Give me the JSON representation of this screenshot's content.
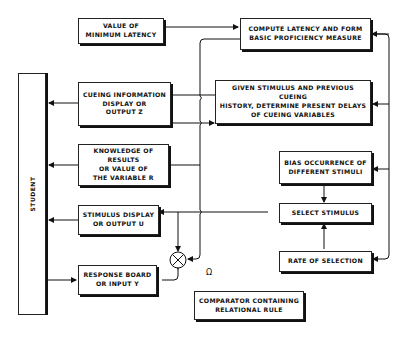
{
  "diagram": {
    "type": "block-diagram",
    "student": {
      "label": "STUDENT"
    },
    "boxes": {
      "min_latency": "VALUE OF\nMINIMUM LATENCY",
      "compute_latency": "COMPUTE LATENCY AND FORM\nBASIC PROFICIENCY MEASURE",
      "cueing_display": "CUEING INFORMATION\nDISPLAY OR\nOUTPUT Z",
      "given_stimulus": "GIVEN STIMULUS AND PREVIOUS CUEING\nHISTORY, DETERMINE PRESENT DELAYS\nOF CUEING VARIABLES",
      "knowledge_results": "KNOWLEDGE OF RESULTS\nOR VALUE OF\nTHE VARIABLE R",
      "bias_occurrence": "BIAS OCCURRENCE OF\nDIFFERENT STIMULI",
      "stimulus_display": "STIMULUS DISPLAY\nOR OUTPUT U",
      "select_stimulus": "SELECT STIMULUS",
      "rate_selection": "RATE OF SELECTION",
      "response_board": "RESPONSE BOARD\nOR INPUT Y",
      "comparator": "COMPARATOR CONTAINING\nRELATIONAL RULE"
    },
    "comparator_symbol": "⊗",
    "omega_label": "Ω",
    "colors": {
      "line": "#111111",
      "background": "#ffffff"
    }
  }
}
